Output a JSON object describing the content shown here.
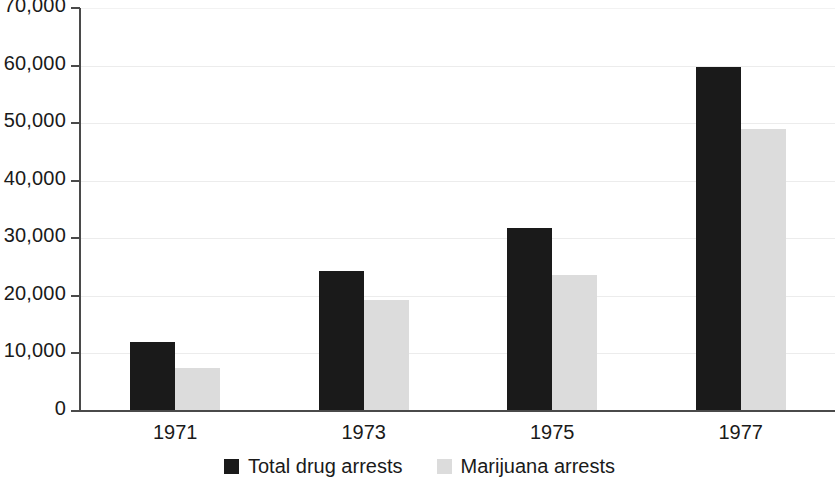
{
  "chart_data": {
    "type": "bar",
    "title": "",
    "subtitle": "",
    "xlabel": "",
    "ylabel": "",
    "categories": [
      "1971",
      "1973",
      "1975",
      "1977"
    ],
    "series": [
      {
        "name": "Total drug arrests",
        "color": "#1a1a1a",
        "values": [
          12000,
          24400,
          31800,
          59700
        ]
      },
      {
        "name": "Marijuana arrests",
        "color": "#dcdcdc",
        "values": [
          7500,
          19300,
          23600,
          48900
        ]
      }
    ],
    "ylim": [
      0,
      70000
    ],
    "ytick_values": [
      0,
      10000,
      20000,
      30000,
      40000,
      50000,
      60000,
      70000
    ],
    "ytick_labels": [
      "0",
      "10,000",
      "20,000",
      "30,000",
      "40,000",
      "50,000",
      "60,000",
      "70,000"
    ],
    "grid": true,
    "grid_axis": "y",
    "legend_position": "bottom-center",
    "background_color": "#ffffff",
    "axis_color": "#4a4a4a",
    "grid_color": "#ececec"
  }
}
